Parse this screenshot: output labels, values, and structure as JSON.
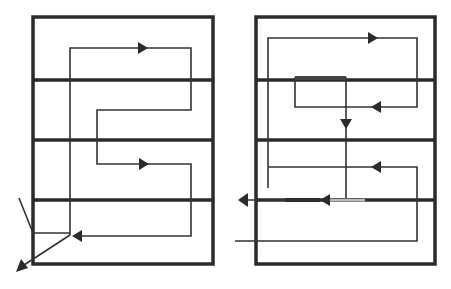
{
  "diagram": {
    "title": "",
    "colors": {
      "background": "#ffffff",
      "frame": "#2b2b2b",
      "path": "#333333",
      "arrow": "#2b2b2b"
    },
    "panels": [
      {
        "id": "left",
        "bands": 4,
        "flow": "serpentine path entering top band, snaking right and left through bands, exiting bottom-left with diagonal arrow"
      },
      {
        "id": "right",
        "bands": 4,
        "flow": "loop through top two bands, vertical drop into third band, leftward exit arrows along third divider"
      }
    ]
  }
}
